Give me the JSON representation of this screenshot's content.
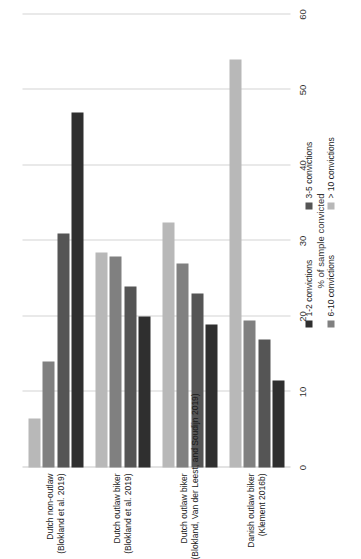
{
  "chart_data": {
    "type": "bar",
    "orientation": "horizontal-grouped",
    "title": "",
    "xlabel": "",
    "ylabel": "% of sample convicted",
    "value_axis_label": "% of sample convicted",
    "ylim": [
      0,
      60
    ],
    "ticks": [
      "0",
      "10",
      "20",
      "30",
      "40",
      "50",
      "60"
    ],
    "tick_values": [
      0,
      10,
      20,
      30,
      40,
      50,
      60
    ],
    "grid": true,
    "legend_position": "bottom-left",
    "categories": [
      {
        "line1": "Dutch non-outlaw",
        "line2": "(Blokland et al. 2019)"
      },
      {
        "line1": "Dutch outlaw biker",
        "line2": "(Blokland et al. 2019)"
      },
      {
        "line1": "Dutch outlaw biker",
        "line2": "(Blokland, Van der Leest, and Soudijn 2019)"
      },
      {
        "line1": "Danish outlaw biker",
        "line2": "(Klement 2016b)"
      }
    ],
    "series": [
      {
        "name": "1-2 convictions",
        "color": "#2f2f2f",
        "values": [
          47.0,
          20.0,
          19.0,
          11.5
        ]
      },
      {
        "name": "3-5 convictions",
        "color": "#555555",
        "values": [
          31.0,
          24.0,
          23.0,
          17.0
        ]
      },
      {
        "name": "6-10 convictions",
        "color": "#808080",
        "values": [
          14.0,
          28.0,
          27.0,
          19.5
        ]
      },
      {
        "name": "> 10 convictions",
        "color": "#b8b8b8",
        "values": [
          6.5,
          28.5,
          32.5,
          54.0
        ]
      }
    ],
    "colors": {
      "grid": "#d3d3d3",
      "axis": "#c8c8c8",
      "text": "#1a1a1a",
      "background": "#ffffff"
    }
  }
}
